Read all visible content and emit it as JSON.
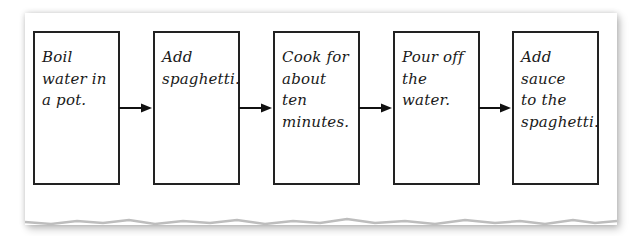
{
  "diagram": {
    "type": "flowchart",
    "direction": "left-to-right",
    "steps": [
      {
        "label": "Boil water in a pot.",
        "lines": [
          "Boil",
          "water in",
          "a pot."
        ]
      },
      {
        "label": "Add spaghetti.",
        "lines": [
          "Add",
          "spaghetti."
        ]
      },
      {
        "label": "Cook for about ten minutes.",
        "lines": [
          "Cook for",
          "about ten",
          "minutes."
        ]
      },
      {
        "label": "Pour off the water.",
        "lines": [
          "Pour off",
          "the water."
        ]
      },
      {
        "label": "Add sauce to the spaghetti.",
        "lines": [
          "Add sauce",
          "to the",
          "spaghetti."
        ]
      }
    ],
    "edges": [
      {
        "from": 0,
        "to": 1
      },
      {
        "from": 1,
        "to": 2
      },
      {
        "from": 2,
        "to": 3
      },
      {
        "from": 3,
        "to": 4
      }
    ],
    "colors": {
      "border": "#222222",
      "text": "#1a1a1a",
      "paper": "#ffffff"
    }
  }
}
